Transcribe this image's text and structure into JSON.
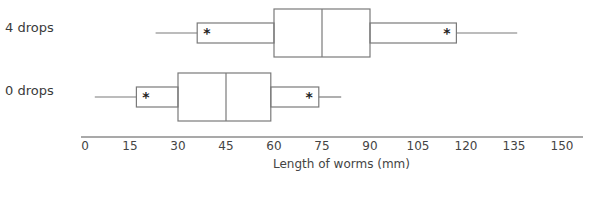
{
  "chart_data": {
    "type": "boxplot",
    "title": "",
    "xlabel": "Length of worms (mm)",
    "ylabel": "",
    "xlim": [
      0,
      150
    ],
    "x_ticks": [
      0,
      15,
      30,
      45,
      60,
      75,
      90,
      105,
      120,
      135,
      150
    ],
    "x_tick_labels": [
      "0",
      "15",
      "30",
      "45",
      "60",
      "75",
      "90",
      "105",
      "120",
      "135",
      "150"
    ],
    "grid": false,
    "legend": null,
    "series": [
      {
        "name": "4 drops",
        "whisker_min": 23,
        "inner_low": 36,
        "q1": 60,
        "median": 75,
        "q3": 90,
        "inner_high": 117,
        "whisker_max": 136,
        "markers": [
          39,
          114
        ],
        "marker_symbol": "*"
      },
      {
        "name": "0 drops",
        "whisker_min": 4,
        "inner_low": 17,
        "q1": 30,
        "median": 45,
        "q3": 59,
        "inner_high": 74,
        "whisker_max": 81,
        "markers": [
          20,
          71
        ],
        "marker_symbol": "*"
      }
    ]
  },
  "labels": {
    "row_4": "4 drops",
    "row_0": "0 drops",
    "xlabel": "Length of worms (mm)",
    "ticks": [
      "0",
      "15",
      "30",
      "45",
      "60",
      "75",
      "90",
      "105",
      "120",
      "135",
      "150"
    ]
  },
  "colors": {
    "line": "#7a7a7a",
    "axis": "#555555",
    "marker": "#222222"
  }
}
